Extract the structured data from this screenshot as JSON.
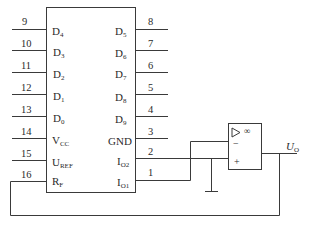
{
  "diagram": {
    "type": "circuit-schematic",
    "chip": {
      "left_pins": [
        {
          "number": "9",
          "signal": "D",
          "sub": "4"
        },
        {
          "number": "10",
          "signal": "D",
          "sub": "3"
        },
        {
          "number": "11",
          "signal": "D",
          "sub": "2"
        },
        {
          "number": "12",
          "signal": "D",
          "sub": "1"
        },
        {
          "number": "13",
          "signal": "D",
          "sub": "0"
        },
        {
          "number": "14",
          "signal": "V",
          "sub": "CC"
        },
        {
          "number": "15",
          "signal": "U",
          "sub": "REF"
        },
        {
          "number": "16",
          "signal": "R",
          "sub": "F"
        }
      ],
      "right_pins": [
        {
          "number": "8",
          "signal": "D",
          "sub": "5"
        },
        {
          "number": "7",
          "signal": "D",
          "sub": "6"
        },
        {
          "number": "6",
          "signal": "D",
          "sub": "7"
        },
        {
          "number": "5",
          "signal": "D",
          "sub": "8"
        },
        {
          "number": "4",
          "signal": "D",
          "sub": "9"
        },
        {
          "number": "3",
          "signal": "GND",
          "sub": ""
        },
        {
          "number": "2",
          "signal": "I",
          "sub": "O2"
        },
        {
          "number": "1",
          "signal": "I",
          "sub": "O1"
        }
      ]
    },
    "opamp": {
      "gain_symbol": "∞",
      "inverting_symbol": "−",
      "noninverting_symbol": "+",
      "output_label": "U",
      "output_sub": "O"
    },
    "colors": {
      "line": "#3a3a3a",
      "text": "#2a2a2a",
      "background": "#ffffff"
    }
  }
}
